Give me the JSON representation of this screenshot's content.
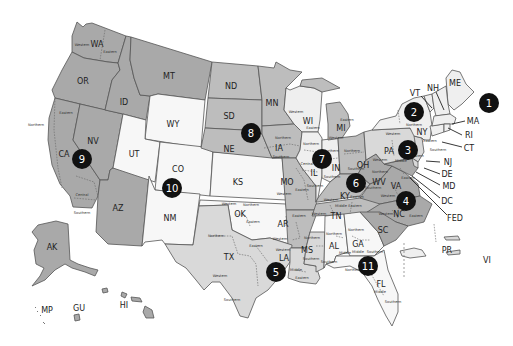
{
  "map": {
    "type": "US Courts of Appeals circuit map",
    "colors": {
      "dark": "#a9a9a9",
      "mid": "#bdbdbd",
      "light": "#d9d9d9",
      "pale": "#efefef",
      "white": "#f7f7f7",
      "marker": "#111111"
    },
    "states": {
      "WA": "WA",
      "OR": "OR",
      "CA": "CA",
      "NV": "NV",
      "ID": "ID",
      "MT": "MT",
      "AZ": "AZ",
      "AK": "AK",
      "HI": "HI",
      "GU": "GU",
      "MP": "MP",
      "WY": "WY",
      "UT": "UT",
      "CO": "CO",
      "KS": "KS",
      "NM": "NM",
      "OK": "OK",
      "ND": "ND",
      "SD": "SD",
      "NE": "NE",
      "MN": "MN",
      "IA": "IA",
      "MO": "MO",
      "AR": "AR",
      "TX": "TX",
      "LA": "LA",
      "MS": "MS",
      "WI": "WI",
      "IL": "IL",
      "IN": "IN",
      "MI": "MI",
      "OH": "OH",
      "KY": "KY",
      "TN": "TN",
      "AL": "AL",
      "GA": "GA",
      "FL": "FL",
      "WV": "WV",
      "VA": "VA",
      "NC": "NC",
      "SC": "SC",
      "MD": "MD",
      "PA": "PA",
      "NJ": "NJ",
      "DE": "DE",
      "VI": "VI",
      "NY": "NY",
      "VT": "VT",
      "CT": "CT",
      "ME": "ME",
      "NH": "NH",
      "MA": "MA",
      "RI": "RI",
      "PR": "PR",
      "DC": "DC",
      "FED": "FED"
    },
    "districts": {
      "wa_w": "Western",
      "wa_e": "Eastern",
      "ca_n": "Northern",
      "ca_e": "Eastern",
      "ca_c": "Central",
      "ca_s": "Southern",
      "wi_w": "Western",
      "wi_e": "Eastern",
      "mi_w": "Western",
      "mi_e": "Eastern",
      "ia_n": "Northern",
      "ia_s": "Southern",
      "mo_w": "Western",
      "mo_e": "Eastern",
      "il_n": "Northern",
      "il_c": "Central",
      "il_s": "Southern",
      "in_n": "Northern",
      "in_s": "Southern",
      "oh_n": "Northern",
      "oh_s": "Southern",
      "ky_w": "Western",
      "ky_e": "Eastern",
      "tn_w": "Western",
      "tn_m": "Middle",
      "tn_e": "Eastern",
      "ok_w": "Western",
      "ok_n": "Northern",
      "ok_e": "Eastern",
      "ar_w": "Western",
      "ar_e": "Eastern",
      "tx_n": "Northern",
      "tx_w": "Western",
      "tx_e": "Eastern",
      "tx_s": "Southern",
      "la_w": "Western",
      "la_m": "Middle",
      "la_e": "Eastern",
      "ms_n": "Northern",
      "ms_s": "Southern",
      "al_n": "Northern",
      "al_m": "Middle",
      "al_s": "Southern",
      "ga_n": "Northern",
      "ga_m": "Middle",
      "ga_s": "Southern",
      "fl_n": "Northern",
      "fl_m": "Middle",
      "fl_s": "Southern",
      "ny_n": "Northern",
      "ny_w": "Western",
      "ny_e": "Eastern",
      "ny_s": "Southern",
      "pa_w": "Western",
      "pa_m": "Middle",
      "pa_e": "Eastern",
      "wv_n": "Northern",
      "wv_s": "Southern",
      "va_w": "Western",
      "va_e": "Eastern",
      "nc_w": "Western",
      "nc_m": "Middle",
      "nc_e": "Eastern"
    },
    "circuits": [
      {
        "number": "1",
        "x": 489,
        "y": 103
      },
      {
        "number": "2",
        "x": 414,
        "y": 112
      },
      {
        "number": "3",
        "x": 408,
        "y": 150
      },
      {
        "number": "4",
        "x": 406,
        "y": 201
      },
      {
        "number": "5",
        "x": 276,
        "y": 272
      },
      {
        "number": "6",
        "x": 356,
        "y": 183
      },
      {
        "number": "7",
        "x": 322,
        "y": 159
      },
      {
        "number": "8",
        "x": 251,
        "y": 133
      },
      {
        "number": "9",
        "x": 82,
        "y": 159
      },
      {
        "number": "10",
        "x": 172,
        "y": 188
      },
      {
        "number": "11",
        "x": 368,
        "y": 266
      }
    ]
  }
}
